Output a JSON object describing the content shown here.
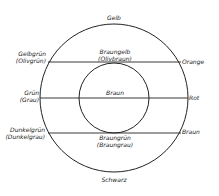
{
  "diagram": {
    "type": "color-relationship-circle",
    "outer_circle": {
      "cx": 114,
      "cy": 98,
      "r": 74
    },
    "inner_circle": {
      "cx": 114,
      "cy": 98,
      "r": 35
    },
    "lines": [
      {
        "y": 62,
        "x1": 48,
        "x2": 181
      },
      {
        "y": 98,
        "x1": 40,
        "x2": 188
      },
      {
        "y": 133,
        "x1": 48,
        "x2": 181
      }
    ],
    "stroke_color": "#222222"
  },
  "labels": {
    "top": "Gelb",
    "bottom": "Schwarz",
    "left_upper_1": "Gelbgrün",
    "left_upper_2": "(Olivgrün)",
    "left_mid_1": "Grün",
    "left_mid_2": "(Grau)",
    "left_lower_1": "Dunkelgrün",
    "left_lower_2": "(Dunkelgrau)",
    "right_upper": "Orange",
    "right_mid": "Rot",
    "right_lower": "Braun",
    "center_upper_1": "Braungelb",
    "center_upper_2": "(Olivbraun)",
    "center_mid": "Braun",
    "center_lower_1": "Braungrün",
    "center_lower_2": "(Braungrau)"
  }
}
